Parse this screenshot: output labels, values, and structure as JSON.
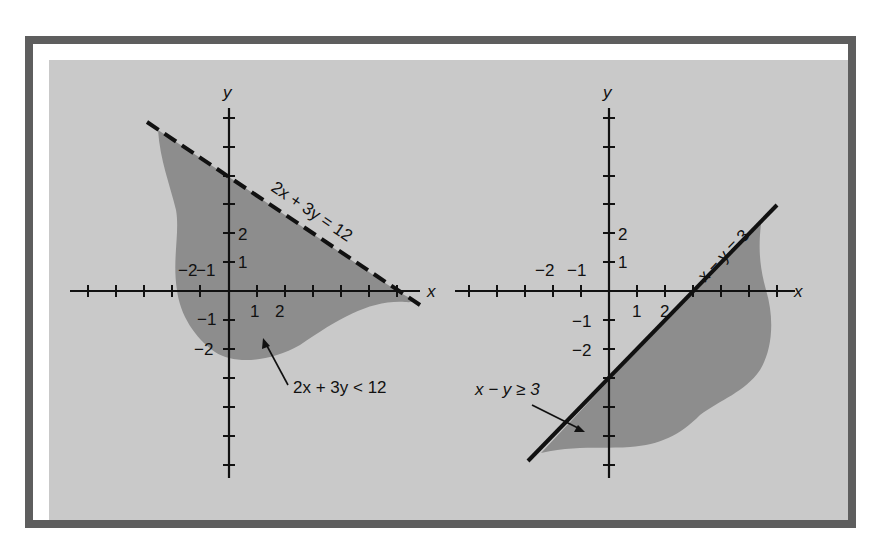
{
  "colors": {
    "frame_border": "#5e5e5e",
    "panel_bg": "#c9c9c9",
    "shaded_region": "#8d8d8d",
    "ink": "#111111"
  },
  "left_graph": {
    "x_axis_label": "x",
    "y_axis_label": "y",
    "x_tick_labels": [
      "−2",
      "−1",
      "1",
      "2"
    ],
    "y_tick_labels": [
      "2",
      "1",
      "−1",
      "−2"
    ],
    "boundary_line": {
      "equation": "2x + 3y = 12",
      "style": "dashed",
      "x_intercept": 6,
      "y_intercept": 4
    },
    "region_label": "2x + 3y < 12"
  },
  "right_graph": {
    "x_axis_label": "x",
    "y_axis_label": "y",
    "x_tick_labels": [
      "−2",
      "−1",
      "1",
      "2"
    ],
    "y_tick_labels": [
      "2",
      "1",
      "−1",
      "−2"
    ],
    "boundary_line": {
      "equation": "x − y = 3",
      "style": "solid",
      "x_intercept": 3,
      "y_intercept": -3
    },
    "region_label": "x − y ≥ 3"
  }
}
